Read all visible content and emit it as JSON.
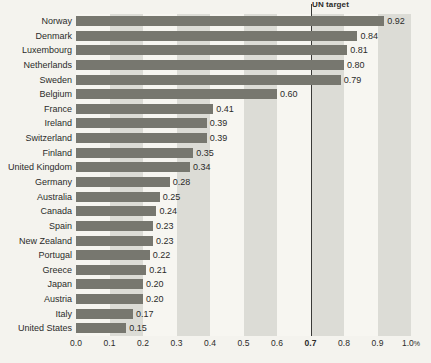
{
  "chart_data": {
    "type": "bar",
    "orientation": "horizontal",
    "title": "",
    "subtitle": "",
    "xlabel": "",
    "ylabel": "",
    "xlim": [
      0.0,
      1.0
    ],
    "xticks": [
      0.0,
      0.1,
      0.2,
      0.3,
      0.4,
      0.5,
      0.6,
      0.7,
      0.8,
      0.9,
      1.0
    ],
    "xtick_labels": [
      "0.0",
      "0.1",
      "0.2",
      "0.3",
      "0.4",
      "0.5",
      "0.6",
      "0.7",
      "0.8",
      "0.9",
      "1.0"
    ],
    "xtick_unit": "%",
    "bold_tick": "0.7",
    "grid": false,
    "band_shading": true,
    "band_ranges": [
      [
        0.1,
        0.2
      ],
      [
        0.3,
        0.4
      ],
      [
        0.5,
        0.6
      ],
      [
        0.7,
        0.8
      ],
      [
        0.9,
        1.0
      ]
    ],
    "categories": [
      "Norway",
      "Denmark",
      "Luxembourg",
      "Netherlands",
      "Sweden",
      "Belgium",
      "France",
      "Ireland",
      "Switzerland",
      "Finland",
      "United Kingdom",
      "Germany",
      "Australia",
      "Canada",
      "Spain",
      "New Zealand",
      "Portugal",
      "Greece",
      "Japan",
      "Austria",
      "Italy",
      "United States"
    ],
    "values": [
      0.92,
      0.84,
      0.81,
      0.8,
      0.79,
      0.6,
      0.41,
      0.39,
      0.39,
      0.35,
      0.34,
      0.28,
      0.25,
      0.24,
      0.23,
      0.23,
      0.22,
      0.21,
      0.2,
      0.2,
      0.17,
      0.15
    ],
    "value_labels": [
      "0.92",
      "0.84",
      "0.81",
      "0.80",
      "0.79",
      "0.60",
      "0.41",
      "0.39",
      "0.39",
      "0.35",
      "0.34",
      "0.28",
      "0.25",
      "0.24",
      "0.23",
      "0.23",
      "0.22",
      "0.21",
      "0.20",
      "0.20",
      "0.17",
      "0.15"
    ],
    "annotations": [
      {
        "name": "un-target",
        "label": "UN target",
        "x": 0.7,
        "type": "vline"
      }
    ],
    "colors": {
      "bar": "#77776f",
      "plot_background": "#f7f6f1",
      "band": "#dcdcd6",
      "page_background": "#f4f3ee",
      "text": "#2b2b2a",
      "target_line": "#3a3a38"
    }
  }
}
